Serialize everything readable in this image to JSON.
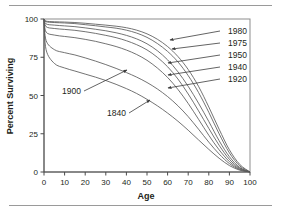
{
  "figure": {
    "background": "#ffffff",
    "rule_color": "#9a9a9a",
    "curve_color": "#5a5a5a",
    "axis_color": "#4a4a4a",
    "frame_color": "#8d8d8d",
    "text_color": "#231f20"
  },
  "chart_data": {
    "type": "line",
    "title": "",
    "subtitle": "",
    "xlabel": "Age",
    "ylabel": "Percent Surviving",
    "xlim": [
      0,
      100
    ],
    "ylim": [
      0,
      100
    ],
    "xticks": [
      0,
      10,
      20,
      30,
      40,
      50,
      60,
      70,
      80,
      90,
      100
    ],
    "yticks": [
      0,
      25,
      50,
      75,
      100
    ],
    "xtick_labels": [
      "0",
      "10",
      "20",
      "30",
      "40",
      "50",
      "60",
      "70",
      "80",
      "90",
      "100"
    ],
    "ytick_labels": [
      "0",
      "25",
      "50",
      "75",
      "100"
    ],
    "grid": false,
    "legend": "inline-annotations-right",
    "x": [
      0,
      1,
      5,
      10,
      15,
      20,
      25,
      30,
      35,
      40,
      45,
      50,
      55,
      60,
      65,
      70,
      75,
      80,
      85,
      90,
      95,
      100
    ],
    "series": [
      {
        "name": "1980",
        "label": "1980",
        "values": [
          100,
          98.6,
          98.2,
          98.0,
          97.7,
          97.2,
          96.6,
          96.0,
          95.3,
          94.3,
          92.7,
          90.3,
          86.8,
          82.0,
          75.5,
          67.0,
          56.0,
          42.5,
          28.0,
          14.5,
          5.0,
          0
        ]
      },
      {
        "name": "1975",
        "label": "1975",
        "values": [
          100,
          98.2,
          97.7,
          97.4,
          97.0,
          96.3,
          95.6,
          94.8,
          94.0,
          92.7,
          90.8,
          88.0,
          84.0,
          78.8,
          72.0,
          63.0,
          52.0,
          39.0,
          25.0,
          12.5,
          4.0,
          0
        ]
      },
      {
        "name": "1950",
        "label": "1950",
        "values": [
          100,
          96.8,
          96.0,
          95.5,
          95.0,
          94.2,
          93.3,
          92.3,
          91.0,
          89.3,
          87.0,
          83.8,
          79.3,
          73.3,
          65.5,
          56.0,
          45.0,
          33.0,
          20.5,
          10.0,
          3.0,
          0
        ]
      },
      {
        "name": "1940",
        "label": "1940",
        "values": [
          100,
          95.0,
          93.8,
          93.2,
          92.6,
          91.7,
          90.6,
          89.3,
          87.8,
          85.8,
          83.2,
          79.8,
          75.0,
          68.8,
          60.8,
          51.0,
          40.0,
          28.5,
          17.5,
          8.3,
          2.5,
          0
        ]
      },
      {
        "name": "1920",
        "label": "1920",
        "values": [
          100,
          91.5,
          89.5,
          88.6,
          87.8,
          86.7,
          85.4,
          83.8,
          82.0,
          79.7,
          76.8,
          73.0,
          68.0,
          61.8,
          54.0,
          44.8,
          34.5,
          24.0,
          14.5,
          6.8,
          2.0,
          0
        ]
      },
      {
        "name": "1900",
        "label": "1900",
        "values": [
          100,
          86.0,
          80.0,
          78.0,
          76.5,
          74.6,
          72.5,
          70.2,
          67.7,
          65.0,
          62.0,
          58.5,
          54.3,
          49.3,
          43.3,
          36.2,
          28.0,
          19.5,
          11.8,
          5.5,
          1.6,
          0
        ]
      },
      {
        "name": "1840",
        "label": "1840",
        "values": [
          100,
          80.0,
          71.0,
          68.0,
          66.0,
          64.0,
          62.0,
          59.8,
          57.3,
          54.5,
          51.3,
          47.5,
          43.3,
          38.5,
          33.2,
          27.3,
          21.0,
          14.8,
          9.0,
          4.2,
          1.2,
          0
        ]
      }
    ],
    "annotations": [
      {
        "text": "1980",
        "label_x": 247,
        "label_y": 34,
        "tip_x": 170,
        "tip_y": 40,
        "anchor": "end"
      },
      {
        "text": "1975",
        "label_x": 247,
        "label_y": 46,
        "tip_x": 172,
        "tip_y": 49,
        "anchor": "end"
      },
      {
        "text": "1950",
        "label_x": 247,
        "label_y": 58,
        "tip_x": 168,
        "tip_y": 63,
        "anchor": "end"
      },
      {
        "text": "1940",
        "label_x": 247,
        "label_y": 70,
        "tip_x": 168,
        "tip_y": 75,
        "anchor": "end"
      },
      {
        "text": "1920",
        "label_x": 247,
        "label_y": 82,
        "tip_x": 168,
        "tip_y": 88,
        "anchor": "end"
      },
      {
        "text": "1900",
        "label_x": 62,
        "label_y": 94,
        "tip_x": 127,
        "tip_y": 70,
        "anchor": "start"
      },
      {
        "text": "1840",
        "label_x": 107,
        "label_y": 116,
        "tip_x": 150,
        "tip_y": 100,
        "anchor": "start"
      }
    ]
  }
}
